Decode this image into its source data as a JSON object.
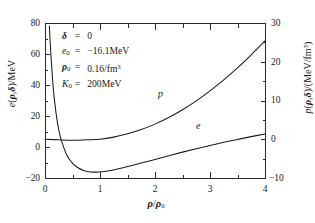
{
  "figure": {
    "xlabel": "ρ/ρ0",
    "ylabel_left": "e(ρ,δ)/MeV",
    "ylabel_right": "p(ρ,δ)/(MeV/fm³)"
  },
  "axes": {
    "x_ticklabels": [
      "0",
      "1",
      "2",
      "3",
      "4"
    ],
    "y_left_ticklabels": [
      "80",
      "60",
      "40",
      "20",
      "0",
      "−20"
    ],
    "y_right_ticklabels": [
      "30",
      "20",
      "10",
      "0",
      "−10"
    ]
  },
  "params": [
    {
      "symbol": "δ",
      "eq": "=",
      "value": "0"
    },
    {
      "symbol": "e",
      "sub": "0",
      "eq": "=",
      "value": "−16.1MeV"
    },
    {
      "symbol": "ρ",
      "sub": "0",
      "eq": "=",
      "value": "0.16/fm³"
    },
    {
      "symbol": "K",
      "sub": "0",
      "eq": "=",
      "value": "200MeV"
    }
  ],
  "curve_labels": {
    "pressure": "p",
    "energy": "e"
  },
  "colors": {
    "axis": "#2b2b2b",
    "curve": "#1a1a1a"
  },
  "chart_data": {
    "type": "line",
    "title": "",
    "xlabel": "ρ/ρ0",
    "ylabel": "e(ρ,δ)/MeV",
    "ylabel_secondary": "p(ρ,δ)/(MeV/fm³)",
    "xlim": [
      0,
      4
    ],
    "ylim": [
      -20,
      80
    ],
    "ylim_secondary": [
      -10,
      30
    ],
    "xticks": [
      0,
      1,
      2,
      3,
      4
    ],
    "yticks": [
      -20,
      0,
      20,
      40,
      60,
      80
    ],
    "yticks_secondary": [
      -10,
      0,
      10,
      20,
      30
    ],
    "grid": false,
    "legend": "inline-annotations",
    "annotations": [
      "δ = 0",
      "e0 = −16.1MeV",
      "ρ0 = 0.16/fm³",
      "K0 = 200MeV"
    ],
    "series": [
      {
        "name": "e",
        "label": "e",
        "axis": "left",
        "units": "MeV",
        "x": [
          0.08,
          0.1,
          0.15,
          0.2,
          0.25,
          0.3,
          0.4,
          0.5,
          0.6,
          0.7,
          0.8,
          0.9,
          1.0,
          1.1,
          1.2,
          1.4,
          1.6,
          1.8,
          2.0,
          2.25,
          2.5,
          2.75,
          3.0,
          3.25,
          3.5,
          3.75,
          4.0
        ],
        "y": [
          78,
          64,
          38,
          22,
          11,
          4,
          -5.5,
          -10.5,
          -13.4,
          -15.1,
          -16.0,
          -16.2,
          -16.1,
          -15.7,
          -15.2,
          -13.6,
          -11.8,
          -9.9,
          -8.0,
          -5.6,
          -3.3,
          -1.1,
          1.0,
          3.0,
          4.9,
          6.7,
          8.4
        ]
      },
      {
        "name": "p",
        "label": "p",
        "axis": "right",
        "units": "MeV/fm^3",
        "x": [
          0,
          0.25,
          0.5,
          0.75,
          1.0,
          1.25,
          1.5,
          1.75,
          2.0,
          2.25,
          2.5,
          2.75,
          3.0,
          3.25,
          3.5,
          3.75,
          4.0
        ],
        "y": [
          0,
          -0.15,
          -0.25,
          -0.15,
          0.0,
          0.55,
          1.4,
          2.5,
          3.9,
          5.6,
          7.6,
          9.9,
          12.5,
          15.3,
          18.4,
          21.8,
          25.4
        ]
      }
    ]
  }
}
